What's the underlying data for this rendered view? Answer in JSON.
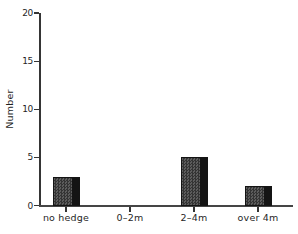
{
  "chart_data": {
    "type": "bar",
    "title": "",
    "categories": [
      "no hedge",
      "0–2m",
      "2–4m",
      "over 4m"
    ],
    "values": [
      3,
      0,
      5,
      2
    ],
    "xlabel": "",
    "ylabel": "Number",
    "ylim": [
      0,
      20
    ],
    "yticks": [
      0,
      5,
      10,
      15,
      20
    ],
    "grid": false,
    "legend_position": "none",
    "bar_fill_color": "#4c4c4c",
    "bar_shade_color": "#141414",
    "bar_edge_color": "#141414",
    "axis_color": "#353535",
    "text_color": "#1f1f1f",
    "background_color": "#ffffff"
  }
}
